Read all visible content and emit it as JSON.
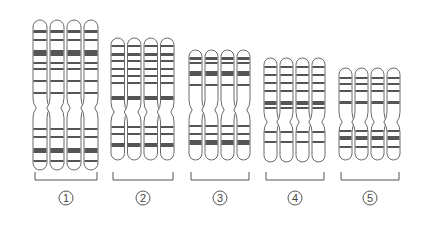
{
  "figure": {
    "stroke_color": "#6a6a6a",
    "band_color": "#555555",
    "groups": [
      {
        "label": "1",
        "symbol": "①",
        "x": 32,
        "width": 68,
        "top": 20,
        "centromere": 108,
        "bottom": 170,
        "bands": [
          {
            "y": 30,
            "h": 3
          },
          {
            "y": 39,
            "h": 2
          },
          {
            "y": 50,
            "h": 6
          },
          {
            "y": 62,
            "h": 2
          },
          {
            "y": 68,
            "h": 2
          },
          {
            "y": 80,
            "h": 2
          },
          {
            "y": 92,
            "h": 2
          },
          {
            "y": 128,
            "h": 2
          },
          {
            "y": 136,
            "h": 2
          },
          {
            "y": 148,
            "h": 5
          },
          {
            "y": 160,
            "h": 2
          }
        ]
      },
      {
        "label": "2",
        "symbol": "②",
        "x": 110,
        "width": 66,
        "top": 38,
        "centromere": 112,
        "bottom": 160,
        "bands": [
          {
            "y": 45,
            "h": 2
          },
          {
            "y": 53,
            "h": 3
          },
          {
            "y": 60,
            "h": 2
          },
          {
            "y": 68,
            "h": 2
          },
          {
            "y": 75,
            "h": 2
          },
          {
            "y": 82,
            "h": 2
          },
          {
            "y": 96,
            "h": 4
          },
          {
            "y": 126,
            "h": 2
          },
          {
            "y": 133,
            "h": 2
          },
          {
            "y": 143,
            "h": 4
          }
        ]
      },
      {
        "label": "3",
        "symbol": "③",
        "x": 188,
        "width": 64,
        "top": 50,
        "centromere": 110,
        "bottom": 160,
        "bands": [
          {
            "y": 57,
            "h": 3
          },
          {
            "y": 62,
            "h": 2
          },
          {
            "y": 71,
            "h": 5
          },
          {
            "y": 84,
            "h": 2
          },
          {
            "y": 125,
            "h": 2
          },
          {
            "y": 133,
            "h": 2
          },
          {
            "y": 140,
            "h": 5
          }
        ]
      },
      {
        "label": "4",
        "symbol": "④",
        "x": 263,
        "width": 64,
        "top": 58,
        "centromere": 122,
        "bottom": 162,
        "bands": [
          {
            "y": 66,
            "h": 2
          },
          {
            "y": 74,
            "h": 2
          },
          {
            "y": 82,
            "h": 2
          },
          {
            "y": 90,
            "h": 2
          },
          {
            "y": 101,
            "h": 4
          },
          {
            "y": 107,
            "h": 2
          },
          {
            "y": 131,
            "h": 2
          },
          {
            "y": 141,
            "h": 2
          }
        ]
      },
      {
        "label": "5",
        "symbol": "⑤",
        "x": 338,
        "width": 64,
        "top": 68,
        "centromere": 122,
        "bottom": 160,
        "bands": [
          {
            "y": 77,
            "h": 2
          },
          {
            "y": 83,
            "h": 2
          },
          {
            "y": 90,
            "h": 2
          },
          {
            "y": 101,
            "h": 3
          },
          {
            "y": 130,
            "h": 2
          },
          {
            "y": 136,
            "h": 4
          },
          {
            "y": 146,
            "h": 2
          }
        ]
      }
    ],
    "bracket": {
      "y_top": 172,
      "y_bottom": 180
    },
    "label_y": 198
  }
}
